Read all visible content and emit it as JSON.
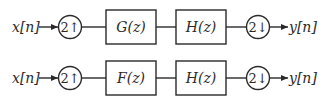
{
  "diagram": {
    "rows": [
      {
        "input_label": "x[n]",
        "upsampler_label": "2↑",
        "block1_label": "G(z)",
        "block2_label": "H(z)",
        "downsampler_label": "2↓",
        "output_label": "y[n]"
      },
      {
        "input_label": "x[n]",
        "upsampler_label": "2↑",
        "block1_label": "F(z)",
        "block2_label": "H(z)",
        "downsampler_label": "2↓",
        "output_label": "y[n]"
      }
    ],
    "colors": {
      "line": "#2a2a2a",
      "background": "#ffffff"
    }
  }
}
